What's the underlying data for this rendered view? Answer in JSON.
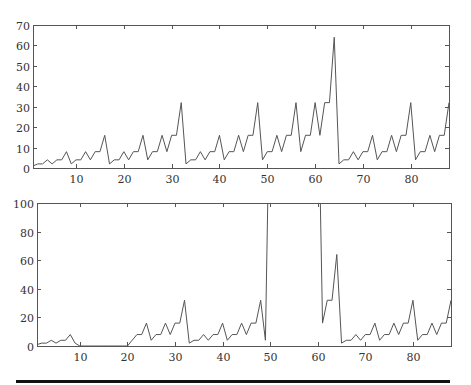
{
  "chart_data": [
    {
      "type": "line",
      "title": "",
      "xlabel": "",
      "ylabel": "",
      "xlim": [
        1,
        88
      ],
      "ylim": [
        0,
        70
      ],
      "grid": false,
      "legend": null,
      "xticks": [
        10,
        20,
        30,
        40,
        50,
        60,
        70,
        80
      ],
      "yticks": [
        0,
        10,
        20,
        30,
        40,
        50,
        60,
        70
      ],
      "x": [
        1,
        2,
        3,
        4,
        5,
        6,
        7,
        8,
        9,
        10,
        11,
        12,
        13,
        14,
        15,
        16,
        17,
        18,
        19,
        20,
        21,
        22,
        23,
        24,
        25,
        26,
        27,
        28,
        29,
        30,
        31,
        32,
        33,
        34,
        35,
        36,
        37,
        38,
        39,
        40,
        41,
        42,
        43,
        44,
        45,
        46,
        47,
        48,
        49,
        50,
        51,
        52,
        53,
        54,
        55,
        56,
        57,
        58,
        59,
        60,
        61,
        62,
        63,
        64,
        65,
        66,
        67,
        68,
        69,
        70,
        71,
        72,
        73,
        74,
        75,
        76,
        77,
        78,
        79,
        80,
        81,
        82,
        83,
        84,
        85,
        86,
        87,
        88
      ],
      "series": [
        {
          "name": "signal",
          "values": [
            1,
            2,
            2,
            4,
            2,
            4,
            4,
            8,
            2,
            4,
            4,
            8,
            4,
            8,
            8,
            16,
            2,
            4,
            4,
            8,
            4,
            8,
            8,
            16,
            4,
            8,
            8,
            16,
            8,
            16,
            16,
            32,
            2,
            4,
            4,
            8,
            4,
            8,
            8,
            16,
            4,
            8,
            8,
            16,
            8,
            16,
            16,
            32,
            4,
            8,
            8,
            16,
            8,
            16,
            16,
            32,
            8,
            16,
            16,
            32,
            16,
            32,
            32,
            64,
            2,
            4,
            4,
            8,
            4,
            8,
            8,
            16,
            4,
            8,
            8,
            16,
            8,
            16,
            16,
            32,
            4,
            8,
            8,
            16,
            8,
            16,
            16,
            32
          ]
        }
      ]
    },
    {
      "type": "line",
      "title": "",
      "xlabel": "",
      "ylabel": "",
      "xlim": [
        1,
        88
      ],
      "ylim": [
        0,
        100
      ],
      "grid": false,
      "legend": null,
      "xticks": [
        10,
        20,
        30,
        40,
        50,
        60,
        70,
        80
      ],
      "yticks": [
        0,
        20,
        40,
        60,
        80,
        100
      ],
      "note": "values at x=50..60 exceed the plotted range (clipped above 100)",
      "x": [
        1,
        2,
        3,
        4,
        5,
        6,
        7,
        8,
        9,
        10,
        11,
        12,
        13,
        14,
        15,
        16,
        17,
        18,
        19,
        20,
        21,
        22,
        23,
        24,
        25,
        26,
        27,
        28,
        29,
        30,
        31,
        32,
        33,
        34,
        35,
        36,
        37,
        38,
        39,
        40,
        41,
        42,
        43,
        44,
        45,
        46,
        47,
        48,
        49,
        50,
        51,
        52,
        53,
        54,
        55,
        56,
        57,
        58,
        59,
        60,
        61,
        62,
        63,
        64,
        65,
        66,
        67,
        68,
        69,
        70,
        71,
        72,
        73,
        74,
        75,
        76,
        77,
        78,
        79,
        80,
        81,
        82,
        83,
        84,
        85,
        86,
        87,
        88
      ],
      "series": [
        {
          "name": "modified signal",
          "values": [
            1,
            2,
            2,
            4,
            2,
            4,
            4,
            8,
            2,
            0,
            0,
            0,
            0,
            0,
            0,
            0,
            0,
            0,
            0,
            0,
            4,
            8,
            8,
            16,
            4,
            8,
            8,
            16,
            8,
            16,
            16,
            32,
            2,
            4,
            4,
            8,
            4,
            8,
            8,
            16,
            4,
            8,
            8,
            16,
            8,
            16,
            16,
            32,
            4,
            200,
            200,
            200,
            200,
            200,
            200,
            200,
            200,
            200,
            200,
            200,
            16,
            32,
            32,
            64,
            2,
            4,
            4,
            8,
            4,
            8,
            8,
            16,
            4,
            8,
            8,
            16,
            8,
            16,
            16,
            32,
            4,
            8,
            8,
            16,
            8,
            16,
            16,
            32
          ]
        }
      ]
    }
  ],
  "layout": {
    "top_plot": {
      "left": 33,
      "top": 25,
      "right": 449,
      "bottom": 168
    },
    "bottom_plot": {
      "left": 37,
      "top": 203,
      "right": 451,
      "bottom": 346
    }
  },
  "colors": {
    "line": "#555555",
    "axis": "#555555",
    "text": "#333333",
    "rule": "#111111"
  }
}
